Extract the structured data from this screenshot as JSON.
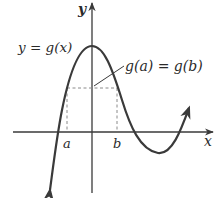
{
  "diagram": {
    "type": "function-graph",
    "colors": {
      "axis": "#3a3a3a",
      "curve": "#3a3a3a",
      "dashed": "#8a8a8a",
      "text": "#2a2a2a"
    },
    "axes": {
      "x_label": "x",
      "y_label": "y"
    },
    "curve": {
      "label_lhs": "y",
      "label_eq": " = ",
      "label_rhs": "g(x)"
    },
    "points": {
      "a_label": "a",
      "b_label": "b"
    },
    "annotation": {
      "text": "g(a) = g(b)"
    }
  }
}
